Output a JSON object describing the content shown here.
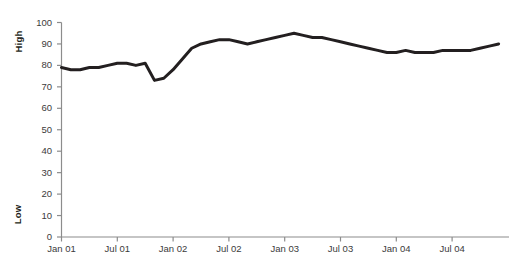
{
  "chart_data": {
    "type": "line",
    "title": "",
    "subtitle": "",
    "xlabel": "",
    "ylabel": "High / Low",
    "y_axis_top_label": "High",
    "y_axis_bottom_label": "Low",
    "ylim": [
      0,
      100
    ],
    "y_ticks": [
      0,
      10,
      20,
      30,
      40,
      50,
      60,
      70,
      80,
      90,
      100
    ],
    "y_tick_labels": [
      "0",
      "10",
      "20",
      "30",
      "40",
      "50",
      "60",
      "70",
      "80",
      "90",
      "100"
    ],
    "x_tick_labels": [
      "Jan 01",
      "Jul 01",
      "Jan 02",
      "Jul 02",
      "Jan 03",
      "Jul 03",
      "Jan 04",
      "Jul 04"
    ],
    "grid": false,
    "legend": "none",
    "line_color": "#231f20",
    "line_width_px": 3,
    "x": [
      "Jan 01",
      "Feb 01",
      "Mar 01",
      "Apr 01",
      "May 01",
      "Jun 01",
      "Jul 01",
      "Aug 01",
      "Sep 01",
      "Oct 01",
      "Nov 01",
      "Dec 01",
      "Jan 02",
      "Feb 02",
      "Mar 02",
      "Apr 02",
      "May 02",
      "Jun 02",
      "Jul 02",
      "Aug 02",
      "Sep 02",
      "Oct 02",
      "Nov 02",
      "Dec 02",
      "Jan 03",
      "Feb 03",
      "Mar 03",
      "Apr 03",
      "May 03",
      "Jun 03",
      "Jul 03",
      "Aug 03",
      "Sep 03",
      "Oct 03",
      "Nov 03",
      "Dec 03",
      "Jan 04",
      "Feb 04",
      "Mar 04",
      "Apr 04",
      "May 04",
      "Jun 04",
      "Jul 04",
      "Aug 04",
      "Sep 04",
      "Oct 04",
      "Nov 04",
      "Dec 04"
    ],
    "values": [
      79,
      78,
      78,
      79,
      79,
      80,
      81,
      81,
      80,
      81,
      73,
      74,
      78,
      83,
      88,
      90,
      91,
      92,
      92,
      91,
      90,
      91,
      92,
      93,
      94,
      95,
      94,
      93,
      93,
      92,
      91,
      90,
      89,
      88,
      87,
      86,
      86,
      87,
      86,
      86,
      86,
      87,
      87,
      87,
      87,
      88,
      89,
      90
    ],
    "series_name": "value",
    "axis_line_color": "#8c8c8c"
  }
}
